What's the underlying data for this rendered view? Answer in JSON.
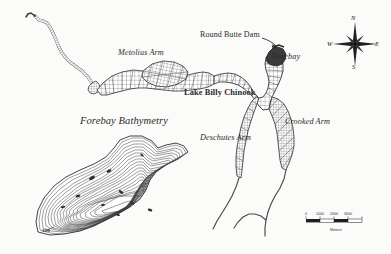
{
  "map": {
    "title_inset": "Forebay Bathymetry",
    "labels": {
      "metolius_arm": "Metolius Arm",
      "round_butte_dam": "Round Butte Dam",
      "forebay": "Forebay",
      "lake_billy_chinook": "Lake Billy Chinook",
      "crooked_arm": "Crooked Arm",
      "deschutes_arm": "Deschutes Arm",
      "contour_depth": "100"
    }
  },
  "compass": {
    "north": "N",
    "south": "S",
    "west": "W",
    "east": "E"
  },
  "scale_bar": {
    "ticks": [
      "0",
      "1000",
      "2000",
      "3000"
    ],
    "unit": "Meters"
  },
  "colors": {
    "background": "#fbfbfa",
    "ink": "#2a2a2a",
    "mesh": "#4a4a4a",
    "fill_dark": "#555555"
  }
}
